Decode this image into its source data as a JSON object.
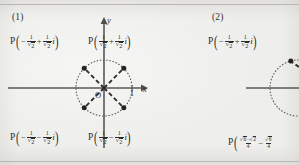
{
  "figure": {
    "background_color": "#eeeeec",
    "ink_color": "#2e2c2b",
    "axis_color": "#5a5855"
  },
  "panels": [
    {
      "number": "(1)",
      "axes": {
        "x_label": "x",
        "y_label": "y",
        "origin_label": "O",
        "unit_tick_label": "1"
      },
      "circle": {
        "radius_units": 1,
        "style": "dotted"
      },
      "points": [
        {
          "id": "p-upper-left",
          "angle_deg": 135,
          "label_prefix": "P",
          "real": "-1/√2",
          "imag": "+1/√2 i"
        },
        {
          "id": "p-upper-right",
          "angle_deg": 45,
          "label_prefix": "P",
          "real": "1/√2",
          "imag": "+1/√2 i"
        },
        {
          "id": "p-lower-left",
          "angle_deg": 225,
          "label_prefix": "P",
          "real": "-1/√2",
          "imag": "-1/√2 i"
        },
        {
          "id": "p-lower-right",
          "angle_deg": 315,
          "label_prefix": "P",
          "real": "1/√2",
          "imag": "-1/√2 i"
        }
      ],
      "labels": {
        "upper_left": {
          "p": "P",
          "num1": "1",
          "den1": "2",
          "op": "+",
          "num2": "1",
          "den2": "2",
          "sign1": "−",
          "i": "i"
        },
        "upper_right": {
          "p": "P",
          "num1": "1",
          "den1": "2",
          "op": "+",
          "num2": "1",
          "den2": "2",
          "sign1": "",
          "i": "i"
        },
        "lower_left": {
          "p": "P",
          "num1": "1",
          "den1": "2",
          "op": "−",
          "num2": "1",
          "den2": "2",
          "sign1": "−",
          "i": "i"
        },
        "lower_right": {
          "p": "P",
          "num1": "1",
          "den1": "2",
          "op": "−",
          "num2": "1",
          "den2": "2",
          "sign1": "",
          "i": "i"
        }
      }
    },
    {
      "number": "(2)",
      "axes": {
        "x_label": "",
        "y_label": "",
        "origin_label": "",
        "unit_tick_label": ""
      },
      "circle": {
        "radius_units": 1,
        "style": "dotted"
      },
      "labels": {
        "upper_left": {
          "p": "P",
          "sign1": "−",
          "num1": "1",
          "den1": "2",
          "op": "+",
          "num2": "1",
          "den2": "2",
          "i": "i"
        },
        "lower_left": {
          "p": "P",
          "frac1_num_a": "6",
          "frac1_num_b": "2",
          "frac1_num_op": "−",
          "frac1_den": "4",
          "op": "−",
          "frac2_num_a": "6",
          "frac2_den": "4"
        }
      }
    }
  ],
  "glyphs": {
    "radical": "√",
    "minus": "−",
    "plus": "+",
    "imaginary_unit": "i"
  }
}
